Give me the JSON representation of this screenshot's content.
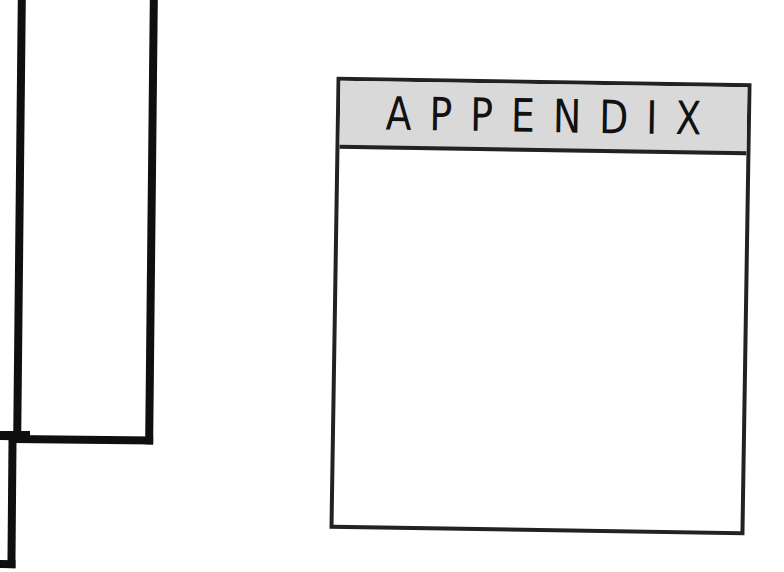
{
  "appendix": {
    "title": "APPENDIX",
    "header_color": "#d9d9d9",
    "border_color": "#222222",
    "body_text": ""
  },
  "decorations": {
    "frame_color": "#0f0f0f"
  }
}
